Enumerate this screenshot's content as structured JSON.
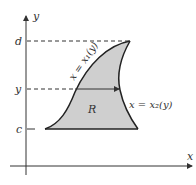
{
  "diagram": {
    "type": "region-between-curves",
    "axes": {
      "x_label": "x",
      "y_label": "y"
    },
    "ticks": {
      "top": "d",
      "middle": "y",
      "bottom": "c"
    },
    "region_label": "R",
    "left_curve_label": "x = x₁(y)",
    "right_curve_label": "x = x₂(y)",
    "colors": {
      "region_fill": "#cfcfcf",
      "stroke": "#222222",
      "text": "#333333"
    }
  }
}
